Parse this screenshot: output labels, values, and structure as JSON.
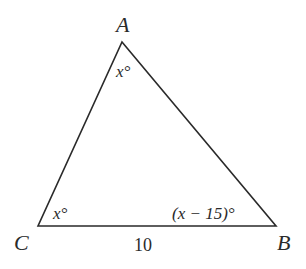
{
  "figure": {
    "type": "triangle",
    "stroke_color": "#2a2a2a",
    "vertices": {
      "A": {
        "label": "A",
        "x": 122,
        "y": 42
      },
      "B": {
        "label": "B",
        "x": 276,
        "y": 226
      },
      "C": {
        "label": "C",
        "x": 38,
        "y": 226
      }
    },
    "angles": {
      "A": {
        "label": "x°"
      },
      "C": {
        "label": "x°"
      },
      "B": {
        "label": "(x − 15)°"
      }
    },
    "sides": {
      "CB": {
        "label": "10"
      }
    }
  }
}
